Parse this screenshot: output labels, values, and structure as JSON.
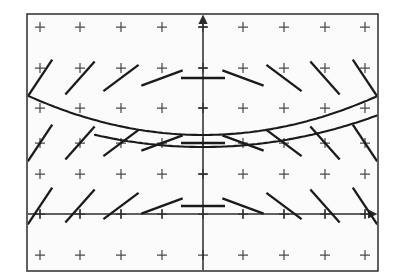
{
  "figure": {
    "type": "slope-field",
    "background_color": "#ffffff",
    "panel_color": "#fbfbfb",
    "ink_color": "#1a1a1a",
    "frame": {
      "x": 27,
      "y": 14,
      "width": 351,
      "height": 257
    }
  },
  "chart_data": {
    "type": "scatter",
    "title": "",
    "subtitle": "",
    "xlabel": "",
    "ylabel": "",
    "xlim": [
      -4.5,
      4.5
    ],
    "ylim": [
      -1.5,
      5.0
    ],
    "grid": false,
    "legend_position": "none",
    "equation": "dy/dx = x",
    "axes": {
      "x_axis_pixel_y": 214,
      "y_axis_pixel_x": 203,
      "x_axis_has_arrow": true,
      "y_axis_has_arrow": true,
      "x_tick_count": 9,
      "y_tick_count": 5
    },
    "grid_markers": {
      "glyph": "+",
      "columns_pixel_x": [
        40,
        80,
        121,
        162,
        203,
        243,
        284,
        325,
        365
      ],
      "rows_pixel_y": [
        27,
        68,
        108,
        143,
        174,
        214,
        255
      ],
      "count": 63
    },
    "slope_field": {
      "segment_half_length_px": 22,
      "slope_rule": "slope = k * x, k = -0.62 per unit",
      "segments": [
        {
          "cx": 40,
          "cy": 78,
          "slope": -1.5
        },
        {
          "cx": 80,
          "cy": 78,
          "slope": -1.12
        },
        {
          "cx": 121,
          "cy": 78,
          "slope": -0.75
        },
        {
          "cx": 162,
          "cy": 78,
          "slope": -0.37
        },
        {
          "cx": 203,
          "cy": 78,
          "slope": 0.0
        },
        {
          "cx": 243,
          "cy": 78,
          "slope": 0.37
        },
        {
          "cx": 284,
          "cy": 78,
          "slope": 0.75
        },
        {
          "cx": 325,
          "cy": 78,
          "slope": 1.12
        },
        {
          "cx": 365,
          "cy": 78,
          "slope": 1.5
        },
        {
          "cx": 40,
          "cy": 143,
          "slope": -1.5
        },
        {
          "cx": 80,
          "cy": 143,
          "slope": -1.12
        },
        {
          "cx": 121,
          "cy": 143,
          "slope": -0.75
        },
        {
          "cx": 162,
          "cy": 143,
          "slope": -0.37
        },
        {
          "cx": 203,
          "cy": 143,
          "slope": 0.0
        },
        {
          "cx": 243,
          "cy": 143,
          "slope": 0.37
        },
        {
          "cx": 284,
          "cy": 143,
          "slope": 0.75
        },
        {
          "cx": 325,
          "cy": 143,
          "slope": 1.12
        },
        {
          "cx": 365,
          "cy": 143,
          "slope": 1.5
        },
        {
          "cx": 40,
          "cy": 206,
          "slope": -1.5
        },
        {
          "cx": 80,
          "cy": 206,
          "slope": -1.12
        },
        {
          "cx": 121,
          "cy": 206,
          "slope": -0.75
        },
        {
          "cx": 162,
          "cy": 206,
          "slope": -0.37
        },
        {
          "cx": 203,
          "cy": 206,
          "slope": 0.0
        },
        {
          "cx": 243,
          "cy": 206,
          "slope": 0.37
        },
        {
          "cx": 284,
          "cy": 206,
          "slope": 0.75
        },
        {
          "cx": 325,
          "cy": 206,
          "slope": 1.12
        },
        {
          "cx": 365,
          "cy": 206,
          "slope": 1.5
        }
      ]
    },
    "solution_curves": [
      {
        "name": "upper-parabola",
        "vertex_pixel": [
          203,
          135
        ],
        "leading_coefficient_px": 0.00128,
        "x_from": 28,
        "x_to": 377
      },
      {
        "name": "lower-parabola",
        "vertex_pixel": [
          203,
          147
        ],
        "leading_coefficient_px": 0.00104,
        "x_from": 95,
        "x_to": 377
      }
    ]
  }
}
